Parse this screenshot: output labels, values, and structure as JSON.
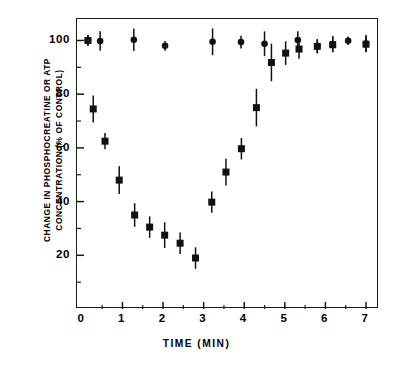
{
  "chart_data": {
    "type": "scatter",
    "title": "",
    "xlabel": "TIME (MIN)",
    "ylabel": "CHANGE IN PHOSPHOCREATINE OR ATP CONCENTRATION (% OF CONTROL)",
    "ylabel_lines": [
      "CHANGE IN PHOSPHOCREATINE OR ATP",
      "CONCENTRATION (% OF CONTROL)"
    ],
    "xlim": [
      -0.12,
      7.32
    ],
    "ylim": [
      0,
      108
    ],
    "xticks": [
      0,
      1,
      2,
      3,
      4,
      5,
      6,
      7
    ],
    "xtick_labels": [
      "0",
      "1",
      "2",
      "3",
      "4",
      "5",
      "6",
      "7"
    ],
    "xminor_ticks": [
      0.5,
      1.5,
      2.5,
      3.5,
      4.5,
      5.5,
      6.5
    ],
    "yticks": [
      20,
      40,
      60,
      80,
      100
    ],
    "ytick_labels": [
      "20",
      "40",
      "60",
      "80",
      "100"
    ],
    "yminor_ticks": [
      10,
      30,
      50,
      70,
      90
    ],
    "grid": false,
    "legend": "none",
    "error_bars": "vertical, standard error",
    "marker_color": "#111111",
    "axis_color": "#1a1a1a",
    "background": "#ffffff",
    "series": [
      {
        "name": "ATP",
        "marker": "circle",
        "points": [
          {
            "x": 0.15,
            "y": 100.0,
            "err": 2.0
          },
          {
            "x": 0.45,
            "y": 99.8,
            "err": 3.6
          },
          {
            "x": 1.28,
            "y": 100.3,
            "err": 4.2
          },
          {
            "x": 2.05,
            "y": 98.0,
            "err": 1.8
          },
          {
            "x": 3.22,
            "y": 99.5,
            "err": 5.0
          },
          {
            "x": 3.92,
            "y": 99.4,
            "err": 2.4
          },
          {
            "x": 4.5,
            "y": 98.8,
            "err": 4.6
          },
          {
            "x": 5.32,
            "y": 100.2,
            "err": 3.2
          },
          {
            "x": 5.8,
            "y": 97.9,
            "err": 2.6
          },
          {
            "x": 6.18,
            "y": 98.7,
            "err": 3.0
          },
          {
            "x": 6.56,
            "y": 99.9,
            "err": 1.6
          },
          {
            "x": 7.0,
            "y": 98.9,
            "err": 3.2
          }
        ]
      },
      {
        "name": "Phosphocreatine",
        "marker": "square",
        "points": [
          {
            "x": 0.15,
            "y": 100.0,
            "err": 2.0
          },
          {
            "x": 0.28,
            "y": 74.5,
            "err": 5.0
          },
          {
            "x": 0.57,
            "y": 62.5,
            "err": 3.0
          },
          {
            "x": 0.92,
            "y": 48.0,
            "err": 5.2
          },
          {
            "x": 1.3,
            "y": 35.0,
            "err": 4.4
          },
          {
            "x": 1.67,
            "y": 30.5,
            "err": 4.0
          },
          {
            "x": 2.04,
            "y": 27.5,
            "err": 4.8
          },
          {
            "x": 2.42,
            "y": 24.5,
            "err": 4.0
          },
          {
            "x": 2.8,
            "y": 19.0,
            "err": 4.0
          },
          {
            "x": 3.2,
            "y": 39.8,
            "err": 4.0
          },
          {
            "x": 3.55,
            "y": 51.0,
            "err": 5.0
          },
          {
            "x": 3.93,
            "y": 59.7,
            "err": 4.0
          },
          {
            "x": 4.3,
            "y": 75.0,
            "err": 7.0
          },
          {
            "x": 4.67,
            "y": 91.8,
            "err": 7.0
          },
          {
            "x": 5.02,
            "y": 95.3,
            "err": 4.4
          },
          {
            "x": 5.35,
            "y": 96.8,
            "err": 3.6
          },
          {
            "x": 5.8,
            "y": 97.8,
            "err": 2.6
          },
          {
            "x": 6.18,
            "y": 98.4,
            "err": 2.8
          },
          {
            "x": 7.0,
            "y": 98.6,
            "err": 3.0
          }
        ]
      }
    ]
  }
}
